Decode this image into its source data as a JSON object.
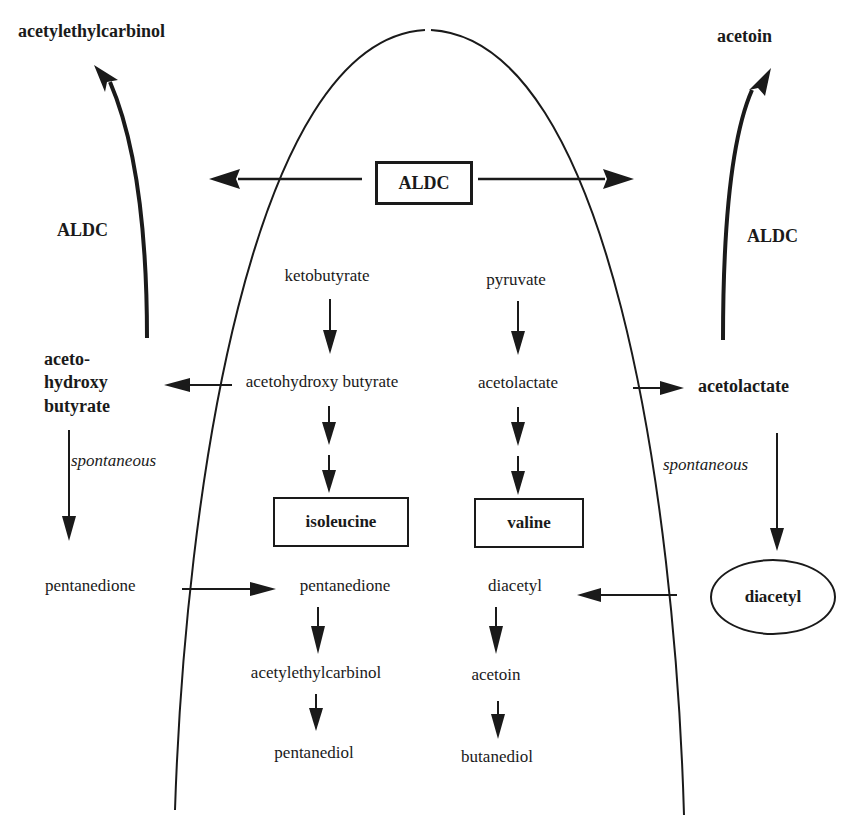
{
  "diagram": {
    "enzyme": "ALDC",
    "outside_left": {
      "top_product": "acetylethylcarbinol",
      "enzyme_label": "ALDC",
      "intermediate_lines": [
        "aceto-",
        "hydroxy",
        "butyrate"
      ],
      "spontaneous_label": "spontaneous",
      "pentanedione": "pentanedione"
    },
    "outside_right": {
      "top_product": "acetoin",
      "enzyme_label": "ALDC",
      "intermediate": "acetolactate",
      "spontaneous_label": "spontaneous",
      "diacetyl": "diacetyl"
    },
    "inside_left": {
      "start": "ketobutyrate",
      "intermediate": "acetohydroxy butyrate",
      "amino_acid": "isoleucine",
      "pentanedione": "pentanedione",
      "acetylethylcarbinol": "acetylethylcarbinol",
      "end": "pentanediol"
    },
    "inside_right": {
      "start": "pyruvate",
      "intermediate": "acetolactate",
      "amino_acid": "valine",
      "diacetyl": "diacetyl",
      "acetoin": "acetoin",
      "end": "butanediol"
    },
    "colors": {
      "ink": "#1a1a1a",
      "background": "#ffffff"
    }
  }
}
